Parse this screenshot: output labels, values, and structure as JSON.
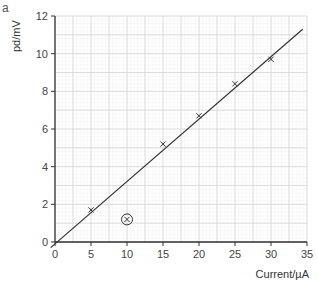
{
  "figure": {
    "part_label": "a"
  },
  "chart_data": {
    "type": "scatter",
    "title": "",
    "xlabel": "Current/µA",
    "ylabel": "pd/mV",
    "xlim": [
      0,
      35
    ],
    "ylim": [
      0,
      12
    ],
    "x_ticks": [
      0,
      5,
      10,
      15,
      20,
      25,
      30,
      35
    ],
    "y_ticks": [
      0,
      2,
      4,
      6,
      8,
      10,
      12
    ],
    "grid": true,
    "legend": null,
    "series": [
      {
        "name": "measurements",
        "marker": "x",
        "points": [
          {
            "x": 5,
            "y": 1.7
          },
          {
            "x": 10,
            "y": 1.2,
            "annotation": "circled anomaly"
          },
          {
            "x": 15,
            "y": 5.2
          },
          {
            "x": 20,
            "y": 6.7
          },
          {
            "x": 25,
            "y": 8.4
          },
          {
            "x": 30,
            "y": 9.7
          }
        ]
      },
      {
        "name": "line of best fit",
        "type": "line",
        "points": [
          {
            "x": -0.6,
            "y": -0.3
          },
          {
            "x": 34.4,
            "y": 11.3
          }
        ]
      }
    ],
    "annotations": [
      "Anomalous point at (10, 1.2) is circled"
    ]
  }
}
